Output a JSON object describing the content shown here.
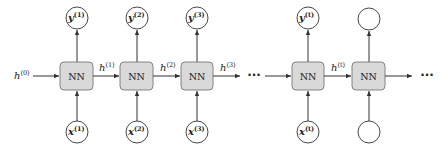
{
  "diagram": {
    "type": "unrolled-rnn",
    "colors": {
      "box_fill": "#d9d9d9",
      "box_stroke": "#777777",
      "line": "#333333",
      "circle_stroke": "#333333"
    },
    "initial_state": {
      "var": "h",
      "sup": "(0)"
    },
    "cells": [
      {
        "box_label": "NN",
        "input": {
          "var": "x",
          "sup": "(1)"
        },
        "output": {
          "var": "y",
          "sup": "(1)"
        },
        "state_out": {
          "var": "h",
          "sup": "(1)"
        }
      },
      {
        "box_label": "NN",
        "input": {
          "var": "x",
          "sup": "(2)"
        },
        "output": {
          "var": "y",
          "sup": "(2)"
        },
        "state_out": {
          "var": "h",
          "sup": "(2)"
        }
      },
      {
        "box_label": "NN",
        "input": {
          "var": "x",
          "sup": "(3)"
        },
        "output": {
          "var": "y",
          "sup": "(3)"
        },
        "state_out": {
          "var": "h",
          "sup": "(3)"
        }
      },
      {
        "box_label": "NN",
        "input": {
          "var": "x",
          "sup": "(t)"
        },
        "output": {
          "var": "y",
          "sup": "(t)"
        },
        "state_out": {
          "var": "h",
          "sup": "(t)"
        }
      },
      {
        "box_label": "NN",
        "input": {
          "var": "",
          "sup": ""
        },
        "output": {
          "var": "",
          "sup": ""
        },
        "state_out": {
          "var": "",
          "sup": ""
        }
      }
    ],
    "ellipsis": "···"
  }
}
